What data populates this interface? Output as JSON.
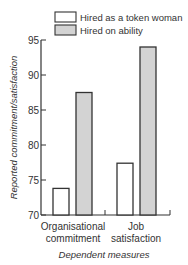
{
  "chart_data": {
    "type": "bar",
    "title": "",
    "xlabel": "Dependent measures",
    "ylabel": "Reported commitment/satisfaction",
    "ylim": [
      70,
      95
    ],
    "yticks": [
      70,
      75,
      80,
      85,
      90,
      95
    ],
    "grid": false,
    "legend_position": "top-right",
    "categories": [
      [
        "Organisational",
        "commitment"
      ],
      [
        "Job",
        "satisfaction"
      ]
    ],
    "series": [
      {
        "name": "Hired as a token woman",
        "color": "#ffffff",
        "values": [
          73.8,
          77.4
        ]
      },
      {
        "name": "Hired on ability",
        "color": "#d3d3d3",
        "values": [
          87.5,
          94.0
        ]
      }
    ]
  }
}
